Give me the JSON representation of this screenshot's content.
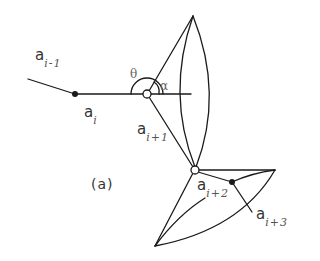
{
  "figure": {
    "panel_label": "(a)",
    "stroke_color": "#1a1a1a",
    "background": "#ffffff"
  },
  "labels": {
    "a_i_minus_1": {
      "base": "a",
      "sub": "i-1"
    },
    "a_i": {
      "base": "a",
      "sub": "i"
    },
    "a_i_plus_1": {
      "base": "a",
      "sub": "i+1"
    },
    "a_i_plus_2": {
      "base": "a",
      "sub": "i+2"
    },
    "a_i_plus_3": {
      "base": "a",
      "sub": "i+3"
    }
  },
  "angles": {
    "theta": "θ",
    "alpha": "α"
  },
  "nodes": [
    {
      "id": "a_i",
      "type": "filled",
      "x": 75,
      "y": 94
    },
    {
      "id": "joint_upper",
      "type": "open",
      "x": 147,
      "y": 94
    },
    {
      "id": "joint_lower",
      "type": "open",
      "x": 195,
      "y": 170
    },
    {
      "id": "a_i_plus_3_node",
      "type": "filled",
      "x": 232,
      "y": 182
    }
  ]
}
